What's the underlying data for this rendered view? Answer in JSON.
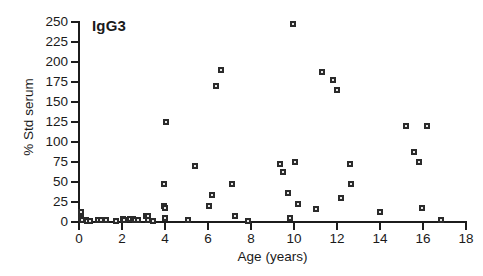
{
  "chart_data": {
    "type": "scatter",
    "title": "IgG3",
    "xlabel": "Age (years)",
    "ylabel": "% Std serum",
    "xlim": [
      0,
      18
    ],
    "ylim": [
      0,
      250
    ],
    "xticks": [
      0,
      2,
      4,
      6,
      8,
      10,
      12,
      14,
      16,
      18
    ],
    "xtick_labels": [
      "0",
      "2",
      "4",
      "6",
      "8",
      "10",
      "12",
      "14",
      "16",
      "18"
    ],
    "yticks": [
      0,
      25,
      50,
      75,
      100,
      125,
      150,
      175,
      200,
      225,
      250
    ],
    "ytick_labels": [
      "0",
      "25",
      "50",
      "75",
      "100",
      "125",
      "150",
      "175",
      "200",
      "225",
      "250"
    ],
    "grid": false,
    "legend": null,
    "marker": "square",
    "marker_color": "#2b2b2b",
    "points": [
      {
        "x": 0.1,
        "y": 13
      },
      {
        "x": 0.1,
        "y": 5
      },
      {
        "x": 0.15,
        "y": 2
      },
      {
        "x": 0.3,
        "y": 3
      },
      {
        "x": 0.35,
        "y": 1
      },
      {
        "x": 0.5,
        "y": 1
      },
      {
        "x": 0.9,
        "y": 2
      },
      {
        "x": 1.0,
        "y": 2
      },
      {
        "x": 1.25,
        "y": 2
      },
      {
        "x": 1.7,
        "y": 1
      },
      {
        "x": 2.05,
        "y": 4
      },
      {
        "x": 2.1,
        "y": 2
      },
      {
        "x": 2.35,
        "y": 4
      },
      {
        "x": 2.5,
        "y": 4
      },
      {
        "x": 2.6,
        "y": 2
      },
      {
        "x": 2.75,
        "y": 2
      },
      {
        "x": 3.1,
        "y": 8
      },
      {
        "x": 3.2,
        "y": 8
      },
      {
        "x": 3.2,
        "y": 2
      },
      {
        "x": 3.45,
        "y": 1
      },
      {
        "x": 3.95,
        "y": 20
      },
      {
        "x": 4.0,
        "y": 17
      },
      {
        "x": 4.0,
        "y": 5
      },
      {
        "x": 3.95,
        "y": 48
      },
      {
        "x": 4.05,
        "y": 125
      },
      {
        "x": 5.05,
        "y": 2
      },
      {
        "x": 5.4,
        "y": 70
      },
      {
        "x": 6.05,
        "y": 20
      },
      {
        "x": 6.2,
        "y": 34
      },
      {
        "x": 6.35,
        "y": 170
      },
      {
        "x": 6.6,
        "y": 190
      },
      {
        "x": 7.1,
        "y": 47
      },
      {
        "x": 7.25,
        "y": 8
      },
      {
        "x": 7.85,
        "y": 1
      },
      {
        "x": 9.35,
        "y": 72
      },
      {
        "x": 9.5,
        "y": 63
      },
      {
        "x": 9.7,
        "y": 36
      },
      {
        "x": 9.8,
        "y": 5
      },
      {
        "x": 9.95,
        "y": 247
      },
      {
        "x": 10.05,
        "y": 75
      },
      {
        "x": 10.2,
        "y": 22
      },
      {
        "x": 11.0,
        "y": 16
      },
      {
        "x": 11.3,
        "y": 188
      },
      {
        "x": 11.8,
        "y": 178
      },
      {
        "x": 12.0,
        "y": 165
      },
      {
        "x": 12.2,
        "y": 30
      },
      {
        "x": 12.6,
        "y": 72
      },
      {
        "x": 12.65,
        "y": 47
      },
      {
        "x": 14.0,
        "y": 12
      },
      {
        "x": 15.2,
        "y": 120
      },
      {
        "x": 15.6,
        "y": 88
      },
      {
        "x": 15.8,
        "y": 75
      },
      {
        "x": 15.95,
        "y": 17
      },
      {
        "x": 16.2,
        "y": 120
      },
      {
        "x": 16.85,
        "y": 2
      }
    ]
  }
}
